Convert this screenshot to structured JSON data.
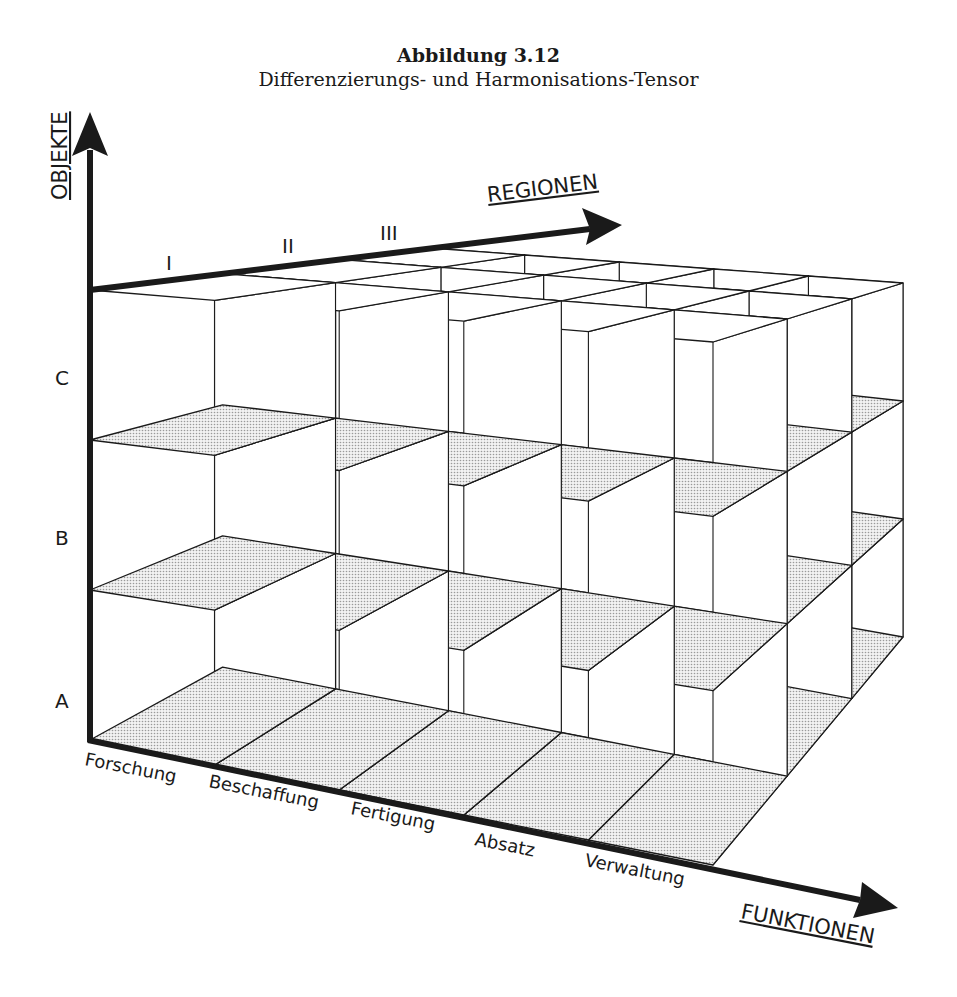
{
  "figure": {
    "number": "Abbildung 3.12",
    "caption": "Differenzierungs- und Harmonisations-Tensor"
  },
  "axes": {
    "vertical": {
      "label": "OBJEKTE",
      "ticks": [
        "A",
        "B",
        "C"
      ]
    },
    "depth": {
      "label": "REGIONEN",
      "ticks": [
        "I",
        "II",
        "III"
      ]
    },
    "horizontal": {
      "label": "FUNKTIONEN",
      "ticks": [
        "Forschung",
        "Beschaffung",
        "Fertigung",
        "Absatz",
        "Verwaltung"
      ]
    }
  },
  "grid": {
    "functions": 5,
    "regions": 3,
    "objects": 3
  },
  "colors": {
    "ink": "#1a1a1a",
    "wall_stipple": "#c8c8c8",
    "floor_stipple": "#9a9a9a",
    "paper": "#ffffff"
  }
}
